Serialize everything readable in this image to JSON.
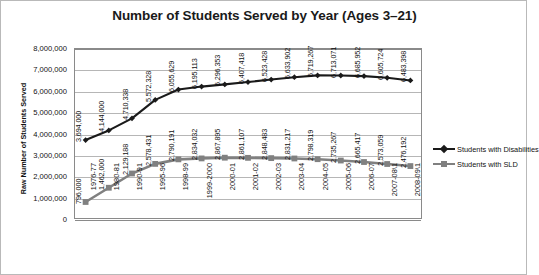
{
  "chart_data": {
    "type": "line",
    "title": "Number of Students Served by Year (Ages 3–21)",
    "xlabel": "",
    "ylabel": "Raw Number of Students Served",
    "ylim": [
      0,
      8000000
    ],
    "grid": true,
    "legend_position": "right",
    "ytick_labels": [
      "8,000,000",
      "7,000,000",
      "6,000,000",
      "5,000,000",
      "4,000,000",
      "3,000,000",
      "2,000,000",
      "1,000,000",
      "0"
    ],
    "ytick_values": [
      8000000,
      7000000,
      6000000,
      5000000,
      4000000,
      3000000,
      2000000,
      1000000,
      0
    ],
    "categories": [
      "1976-77",
      "1980-81",
      "1990-91",
      "1995-96",
      "1998-99",
      "1999-2000",
      "2000-01",
      "2001-02",
      "2002-03",
      "2003-04",
      "2004-05",
      "2005-06",
      "2006-07",
      "2007-08\\1",
      "2008-09\\1"
    ],
    "series": [
      {
        "name": "Students with Disabilities",
        "color": "#1a1a1a",
        "marker": "diamond",
        "values": [
          3694000,
          4144000,
          4710338,
          5572328,
          6055629,
          6195113,
          6296353,
          6407418,
          6523428,
          6633902,
          6719267,
          6713071,
          6685952,
          6605724,
          6483398
        ],
        "labels": [
          "3,694,000",
          "4,144,000",
          "4,710,338",
          "5,572,328",
          "6,055,629",
          "6,195,113",
          "6,296,353",
          "6,407,418",
          "6,523,428",
          "6,633,902",
          "6,719,267",
          "6,713,071",
          "6,685,952",
          "6,605,724",
          "6,483,398"
        ]
      },
      {
        "name": "Students with SLD",
        "color": "#808080",
        "marker": "square",
        "values": [
          796000,
          1462000,
          2129188,
          2578431,
          2790191,
          2834032,
          2867895,
          2861107,
          2848483,
          2831217,
          2798319,
          2735267,
          2665417,
          2573059,
          2476192
        ],
        "labels": [
          "796,000",
          "1,462,000",
          "2,129,188",
          "2,578,431",
          "2,790,191",
          "2,834,032",
          "2,867,895",
          "2,861,107",
          "2,848,483",
          "2,831,217",
          "2,798,319",
          "2,735,267",
          "2,665,417",
          "2,573,059",
          "2,476,192"
        ]
      }
    ]
  },
  "legend": {
    "items": [
      {
        "label": "Students with Disabilities",
        "color": "#1a1a1a"
      },
      {
        "label": "Students with SLD",
        "color": "#808080"
      }
    ]
  }
}
